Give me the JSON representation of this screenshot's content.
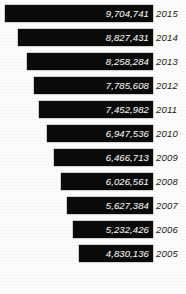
{
  "chart_data": {
    "type": "bar",
    "orientation": "horizontal",
    "title": "",
    "subtitle": "",
    "xlabel": "",
    "ylabel": "",
    "grid": false,
    "legend": null,
    "axis_visible": false,
    "align": "right-aligned-funnel",
    "categories": [
      "2015",
      "2014",
      "2013",
      "2012",
      "2011",
      "2010",
      "2009",
      "2008",
      "2007",
      "2006",
      "2005"
    ],
    "values": [
      9704741,
      8827431,
      8258284,
      7785608,
      7452982,
      6947536,
      6466713,
      6026561,
      5627384,
      5232426,
      4830136
    ],
    "value_labels": [
      "9,704,741",
      "8,827,431",
      "8,258,284",
      "7,785,608",
      "7,452,982",
      "6,947,536",
      "6,466,713",
      "6,026,561",
      "5,627,384",
      "5,232,426",
      "4,830,136"
    ],
    "xlim": [
      0,
      9704741
    ],
    "colors": {
      "bar": "#0a0a0a",
      "value_text": "#f2f2f0",
      "year_text": "#191919",
      "background": "#fdfdfc"
    }
  },
  "bars": [
    {
      "year": "2015",
      "value_label": "9,704,741",
      "value": 9704741,
      "top": 5,
      "left": 5,
      "width": 148
    },
    {
      "year": "2014",
      "value_label": "8,827,431",
      "value": 8827431,
      "top": 29,
      "left": 18,
      "width": 135
    },
    {
      "year": "2013",
      "value_label": "8,258,284",
      "value": 8258284,
      "top": 53,
      "left": 27,
      "width": 126
    },
    {
      "year": "2012",
      "value_label": "7,785,608",
      "value": 7785608,
      "top": 77,
      "left": 34,
      "width": 119
    },
    {
      "year": "2011",
      "value_label": "7,452,982",
      "value": 7452982,
      "top": 101,
      "left": 39,
      "width": 114
    },
    {
      "year": "2010",
      "value_label": "6,947,536",
      "value": 6947536,
      "top": 125,
      "left": 47,
      "width": 106
    },
    {
      "year": "2009",
      "value_label": "6,466,713",
      "value": 6466713,
      "top": 149,
      "left": 54,
      "width": 99
    },
    {
      "year": "2008",
      "value_label": "6,026,561",
      "value": 6026561,
      "top": 173,
      "left": 61,
      "width": 92
    },
    {
      "year": "2007",
      "value_label": "5,627,384",
      "value": 5627384,
      "top": 197,
      "left": 67,
      "width": 86
    },
    {
      "year": "2006",
      "value_label": "5,232,426",
      "value": 5232426,
      "top": 221,
      "left": 73,
      "width": 80
    },
    {
      "year": "2005",
      "value_label": "4,830,136",
      "value": 4830136,
      "top": 245,
      "left": 79,
      "width": 74
    }
  ]
}
